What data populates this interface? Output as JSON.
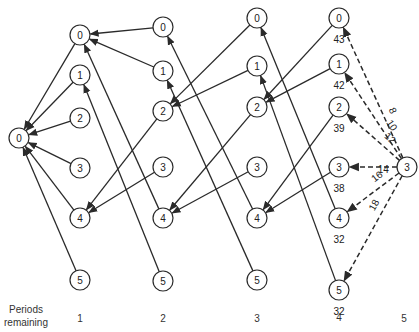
{
  "diagram": {
    "type": "dynamic-programming-network",
    "axis": {
      "title_line1": "Periods",
      "title_line2": "remaining",
      "periods": [
        "1",
        "2",
        "3",
        "4",
        "5"
      ]
    },
    "columns": [
      {
        "period": "0",
        "x": 19,
        "nodes": [
          {
            "label": "0",
            "y": 138
          }
        ]
      },
      {
        "period": "1",
        "x": 80,
        "nodes": [
          {
            "label": "0",
            "y": 35
          },
          {
            "label": "1",
            "y": 75
          },
          {
            "label": "2",
            "y": 118
          },
          {
            "label": "3",
            "y": 168
          },
          {
            "label": "4",
            "y": 218
          },
          {
            "label": "5",
            "y": 280
          }
        ]
      },
      {
        "period": "2",
        "x": 163,
        "nodes": [
          {
            "label": "0",
            "y": 27
          },
          {
            "label": "1",
            "y": 71
          },
          {
            "label": "2",
            "y": 111
          },
          {
            "label": "3",
            "y": 167
          },
          {
            "label": "4",
            "y": 218
          },
          {
            "label": "5",
            "y": 281
          }
        ]
      },
      {
        "period": "3",
        "x": 257,
        "nodes": [
          {
            "label": "0",
            "y": 18
          },
          {
            "label": "1",
            "y": 66
          },
          {
            "label": "2",
            "y": 107
          },
          {
            "label": "3",
            "y": 167
          },
          {
            "label": "4",
            "y": 218
          },
          {
            "label": "5",
            "y": 280
          }
        ]
      },
      {
        "period": "4",
        "x": 339,
        "nodes": [
          {
            "label": "0",
            "y": 18,
            "value": "43"
          },
          {
            "label": "1",
            "y": 64,
            "value": "42"
          },
          {
            "label": "2",
            "y": 107,
            "value": "39"
          },
          {
            "label": "3",
            "y": 167,
            "value": "38"
          },
          {
            "label": "4",
            "y": 218,
            "value": "32"
          },
          {
            "label": "5",
            "y": 290,
            "value": "32"
          }
        ]
      },
      {
        "period": "5",
        "x": 407,
        "nodes": [
          {
            "label": "3",
            "y": 167
          }
        ]
      }
    ],
    "edges": [
      {
        "from": [
          1,
          0
        ],
        "to": [
          0,
          0
        ]
      },
      {
        "from": [
          1,
          1
        ],
        "to": [
          0,
          0
        ]
      },
      {
        "from": [
          1,
          2
        ],
        "to": [
          0,
          0
        ]
      },
      {
        "from": [
          1,
          3
        ],
        "to": [
          0,
          0
        ]
      },
      {
        "from": [
          1,
          4
        ],
        "to": [
          0,
          0
        ]
      },
      {
        "from": [
          1,
          5
        ],
        "to": [
          0,
          0
        ]
      },
      {
        "from": [
          2,
          0
        ],
        "to": [
          1,
          0
        ]
      },
      {
        "from": [
          2,
          1
        ],
        "to": [
          1,
          0
        ]
      },
      {
        "from": [
          2,
          4
        ],
        "to": [
          1,
          0
        ]
      },
      {
        "from": [
          2,
          5
        ],
        "to": [
          1,
          1
        ]
      },
      {
        "from": [
          2,
          2
        ],
        "to": [
          1,
          4
        ]
      },
      {
        "from": [
          2,
          3
        ],
        "to": [
          1,
          4
        ]
      },
      {
        "from": [
          3,
          0
        ],
        "to": [
          2,
          2
        ]
      },
      {
        "from": [
          3,
          1
        ],
        "to": [
          2,
          2
        ]
      },
      {
        "from": [
          3,
          2
        ],
        "to": [
          2,
          4
        ]
      },
      {
        "from": [
          3,
          3
        ],
        "to": [
          2,
          4
        ]
      },
      {
        "from": [
          3,
          4
        ],
        "to": [
          2,
          0
        ]
      },
      {
        "from": [
          3,
          5
        ],
        "to": [
          2,
          1
        ]
      },
      {
        "from": [
          4,
          0
        ],
        "to": [
          3,
          2
        ]
      },
      {
        "from": [
          4,
          1
        ],
        "to": [
          3,
          2
        ]
      },
      {
        "from": [
          4,
          2
        ],
        "to": [
          3,
          4
        ]
      },
      {
        "from": [
          4,
          3
        ],
        "to": [
          3,
          4
        ]
      },
      {
        "from": [
          4,
          4
        ],
        "to": [
          3,
          0
        ]
      },
      {
        "from": [
          4,
          5
        ],
        "to": [
          3,
          1
        ]
      }
    ],
    "dashed_edges": [
      {
        "from": [
          5,
          0
        ],
        "to": [
          4,
          0
        ],
        "cost": "8"
      },
      {
        "from": [
          5,
          0
        ],
        "to": [
          4,
          1
        ],
        "cost": "10"
      },
      {
        "from": [
          5,
          0
        ],
        "to": [
          4,
          2
        ],
        "cost": "12"
      },
      {
        "from": [
          5,
          0
        ],
        "to": [
          4,
          3
        ],
        "cost": "14"
      },
      {
        "from": [
          5,
          0
        ],
        "to": [
          4,
          4
        ],
        "cost": "16"
      },
      {
        "from": [
          5,
          0
        ],
        "to": [
          4,
          5
        ],
        "cost": "18"
      }
    ],
    "colors": {
      "stroke": "#2a2a2a",
      "background": "#ffffff"
    }
  }
}
